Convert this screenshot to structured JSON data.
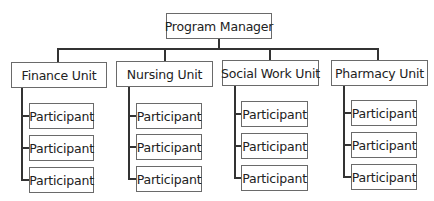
{
  "diagram": {
    "type": "org-chart",
    "root": {
      "label": "Program Manager"
    },
    "units": [
      {
        "label": "Finance Unit",
        "participants": [
          "Participant",
          "Participant",
          "Participant"
        ]
      },
      {
        "label": "Nursing Unit",
        "participants": [
          "Participant",
          "Participant",
          "Participant"
        ]
      },
      {
        "label": "Social Work Unit",
        "participants": [
          "Participant",
          "Participant",
          "Participant"
        ]
      },
      {
        "label": "Pharmacy Unit",
        "participants": [
          "Participant",
          "Participant",
          "Participant"
        ]
      }
    ],
    "colors": {
      "line": "#333333",
      "border": "#6a6a6a",
      "background": "#ffffff",
      "text": "#222222"
    }
  }
}
